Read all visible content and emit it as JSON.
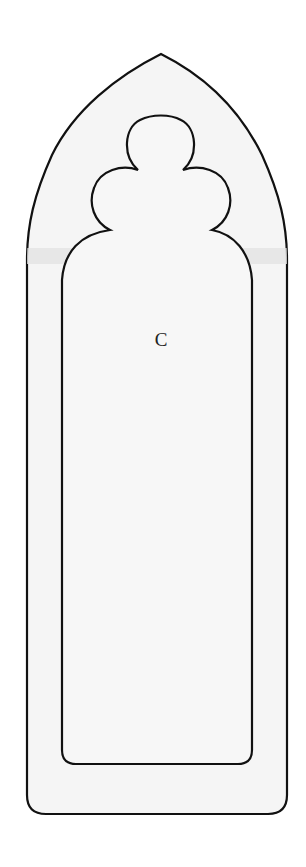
{
  "diagram": {
    "type": "gothic-arch-template",
    "label": "C",
    "colors": {
      "background": "#ffffff",
      "fill": "#f4f4f4",
      "band": "#e6e6e6",
      "stroke": "#111111"
    }
  }
}
